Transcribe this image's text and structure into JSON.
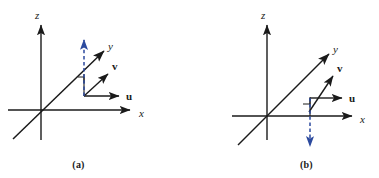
{
  "figure": {
    "background_color": "#ffffff",
    "axis_color": "#1a1a1a",
    "vector_color": "#1a1a1a",
    "cross_product_color": "#2c4a9e"
  },
  "panels": [
    {
      "caption": "(a)",
      "axes": {
        "x_label": "x",
        "y_label": "y",
        "z_label": "z"
      },
      "vectors": [
        {
          "name": "u",
          "label": "u"
        },
        {
          "name": "v",
          "label": "v"
        }
      ],
      "cross_product": {
        "name": "u-cross-v",
        "direction": "up",
        "style": "dashed",
        "color": "#2c4a9e"
      },
      "right_angle_marker": true
    },
    {
      "caption": "(b)",
      "axes": {
        "x_label": "x",
        "y_label": "y",
        "z_label": "z"
      },
      "vectors": [
        {
          "name": "u",
          "label": "u"
        },
        {
          "name": "v",
          "label": "v"
        }
      ],
      "cross_product": {
        "name": "v-cross-u",
        "direction": "down",
        "style": "dashed",
        "color": "#2c4a9e"
      },
      "right_angle_marker": true
    }
  ]
}
